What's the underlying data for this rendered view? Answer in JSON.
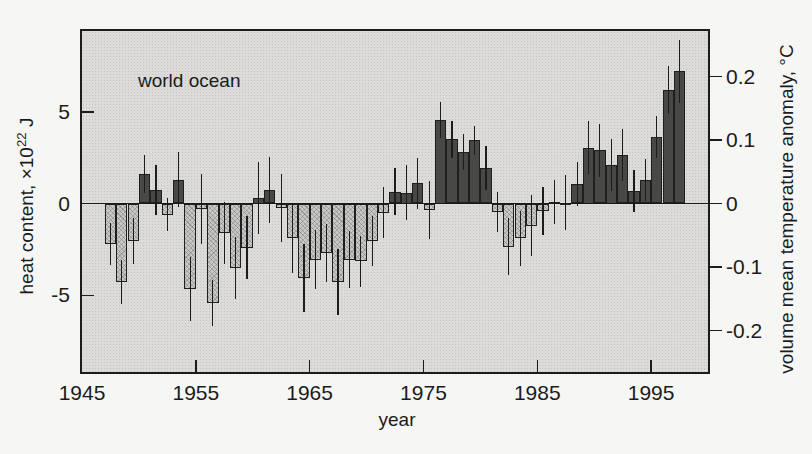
{
  "chart_data": {
    "type": "bar",
    "title": "world ocean",
    "xlabel": "year",
    "ylabel_left": "heat content, ×10²² J",
    "ylabel_left_parts": {
      "prefix": "heat content, ×10",
      "sup": "22",
      "suffix": " J"
    },
    "ylabel_right": "volume mean temperature anomaly, °C",
    "xlim": [
      1945,
      2000
    ],
    "ylim_left": [
      -9.3,
      9.4
    ],
    "ylim_right": [
      -0.27,
      0.27
    ],
    "x_ticks": [
      "1945",
      "1955",
      "1965",
      "1975",
      "1985",
      "1995"
    ],
    "y_left_ticks": [
      "5",
      "0",
      "-5"
    ],
    "y_right_ticks": [
      "0.2",
      "0.1",
      "0",
      "-0.1",
      "-0.2"
    ],
    "unit_left": "×10²² J",
    "unit_right": "°C",
    "grid": false,
    "legend": false,
    "bar_colors": {
      "positive": "#484846",
      "negative": "#c7c7c5"
    },
    "plot_background": "#dcdbd9",
    "error_bars": true,
    "years": [
      1948,
      1949,
      1950,
      1951,
      1952,
      1953,
      1954,
      1955,
      1956,
      1957,
      1958,
      1959,
      1960,
      1961,
      1962,
      1963,
      1964,
      1965,
      1966,
      1967,
      1968,
      1969,
      1970,
      1971,
      1972,
      1973,
      1974,
      1975,
      1976,
      1977,
      1978,
      1979,
      1980,
      1981,
      1982,
      1983,
      1984,
      1985,
      1986,
      1987,
      1988,
      1989,
      1990,
      1991,
      1992,
      1993,
      1994,
      1995,
      1996,
      1997,
      1998
    ],
    "values": [
      -2.2,
      -4.3,
      -2.05,
      1.6,
      0.75,
      -0.6,
      1.3,
      -4.65,
      -0.3,
      -5.4,
      -1.6,
      -3.5,
      -2.4,
      0.3,
      0.75,
      -0.25,
      -1.9,
      -4.05,
      -3.05,
      -2.7,
      -4.25,
      -3.05,
      -3.15,
      -2.05,
      -0.5,
      0.65,
      0.6,
      1.1,
      -0.35,
      4.55,
      3.5,
      2.8,
      3.45,
      1.95,
      -0.45,
      -2.35,
      -1.9,
      -1.2,
      -0.4,
      0.1,
      0.05,
      1.05,
      3.05,
      2.9,
      2.1,
      2.65,
      0.7,
      1.3,
      3.6,
      6.2,
      7.2
    ],
    "error_half_range": [
      1.15,
      1.2,
      1.25,
      1.05,
      1.35,
      0.9,
      1.5,
      1.75,
      1.9,
      1.25,
      1.7,
      1.7,
      1.7,
      1.95,
      1.8,
      1.85,
      1.9,
      1.85,
      1.6,
      1.6,
      1.8,
      1.55,
      1.4,
      1.35,
      1.4,
      1.3,
      1.5,
      1.4,
      1.6,
      1.0,
      1.0,
      1.0,
      0.8,
      1.2,
      1.1,
      1.55,
      1.5,
      1.65,
      1.3,
      1.2,
      1.5,
      1.2,
      1.45,
      1.45,
      1.4,
      1.4,
      1.15,
      1.15,
      1.15,
      1.3,
      1.7
    ]
  }
}
